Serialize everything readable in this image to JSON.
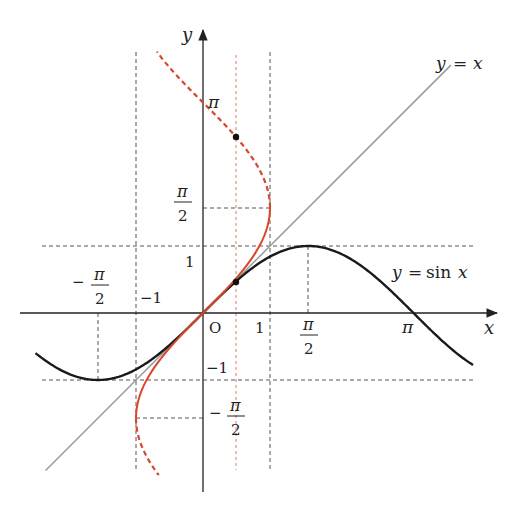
{
  "figure": {
    "type": "function-graph",
    "colors": {
      "axes": "#222222",
      "sine_curve": "#1a1a1a",
      "identity_line": "#999999",
      "inverse_curve": "#d9472b",
      "guide_lines": "#555555",
      "red_guide": "#e07a6a"
    },
    "axes": {
      "x_label": "x",
      "y_label": "y",
      "origin_label": "O"
    },
    "x_ticks": [
      {
        "value": -1.5708,
        "label_prefix": "−",
        "num": "π",
        "den": "2"
      },
      {
        "value": -1,
        "label": "−1"
      },
      {
        "value": 1,
        "label": "1"
      },
      {
        "value": 1.5708,
        "num": "π",
        "den": "2"
      },
      {
        "value": 3.1416,
        "label": "π"
      }
    ],
    "y_ticks": [
      {
        "value": 3.1416,
        "label": "π"
      },
      {
        "value": 1.5708,
        "num": "π",
        "den": "2"
      },
      {
        "value": 1,
        "label": "1"
      },
      {
        "value": -1,
        "label": "−1"
      },
      {
        "value": -1.5708,
        "label_prefix": "−",
        "num": "π",
        "den": "2"
      }
    ],
    "curve_labels": {
      "identity": "y = x",
      "sine": "y = sin x"
    },
    "labels": {
      "pi": "π",
      "two": "2",
      "minus": "−",
      "one": "1",
      "neg_one": "−1",
      "x": "x",
      "y": "y",
      "origin": "O",
      "identity_y": "y",
      "identity_eq": "=",
      "identity_x": "x",
      "sine_y": "y",
      "sine_eq": "=",
      "sine_fn": "sin",
      "sine_x": "x"
    },
    "points": [
      {
        "x": 0.5,
        "y": 0.5236,
        "note": "arcsin point on x = sin y"
      },
      {
        "x": 0.5,
        "y": 2.618,
        "note": "second solution π − arcsin(0.5)"
      }
    ]
  },
  "chart_data": {
    "type": "line",
    "title": "",
    "xlabel": "x",
    "ylabel": "y",
    "xlim": [
      -2.7,
      4.4
    ],
    "ylim": [
      -2.6,
      4.2
    ],
    "grid": false,
    "series": [
      {
        "name": "y = sin x",
        "style": "solid black",
        "domain": [
          -2.5,
          4.03
        ],
        "function": "sin(x)"
      },
      {
        "name": "y = x",
        "style": "solid gray",
        "domain": [
          -2.35,
          3.7
        ],
        "function": "x"
      },
      {
        "name": "x = sin y (principal, arcsin)",
        "style": "solid red",
        "y_range": [
          -1.5708,
          1.5708
        ],
        "function": "x = sin(y)"
      },
      {
        "name": "x = sin y (other branches)",
        "style": "dashed red",
        "y_range": [
          [
            -2.42,
            -1.5708
          ],
          [
            1.5708,
            3.9
          ]
        ],
        "function": "x = sin(y)"
      }
    ],
    "guide_lines": {
      "vertical_dashed": [
        -1.5708,
        -1,
        1,
        1.5708
      ],
      "vertical_red_dashed": [
        0.5
      ],
      "horizontal_dashed": [
        1.5708,
        1,
        -1,
        -1.5708
      ]
    },
    "marked_points": [
      [
        0.5,
        0.5236
      ],
      [
        0.5,
        2.618
      ]
    ]
  }
}
